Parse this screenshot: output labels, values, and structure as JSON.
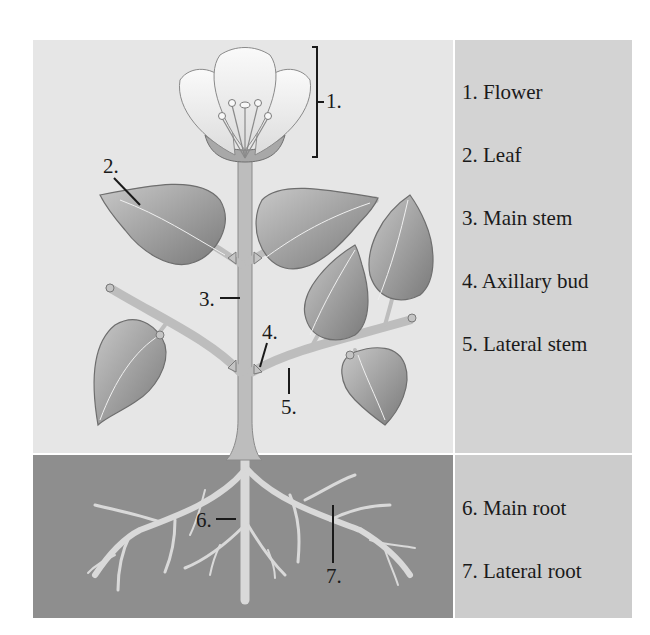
{
  "diagram": {
    "colors": {
      "sky_bg": "#e6e6e6",
      "soil_bg": "#8e8e8e",
      "legend_top_bg": "#d3d3d3",
      "legend_bottom_bg": "#cccccc",
      "text": "#1a1a1a",
      "leaf_fill": "#9e9e9e",
      "stem_fill": "#bdbdbd",
      "root_fill": "#d9d9d9",
      "petal_fill": "#f4f4f4"
    },
    "callouts": [
      {
        "id": "1",
        "text": "1."
      },
      {
        "id": "2",
        "text": "2."
      },
      {
        "id": "3",
        "text": "3."
      },
      {
        "id": "4",
        "text": "4."
      },
      {
        "id": "5",
        "text": "5."
      },
      {
        "id": "6",
        "text": "6."
      },
      {
        "id": "7",
        "text": "7."
      }
    ],
    "legend": {
      "above_ground": [
        {
          "number": "1.",
          "label": "1. Flower"
        },
        {
          "number": "2.",
          "label": "2. Leaf"
        },
        {
          "number": "3.",
          "label": "3. Main stem"
        },
        {
          "number": "4.",
          "label": "4. Axillary bud"
        },
        {
          "number": "5.",
          "label": "5. Lateral stem"
        }
      ],
      "below_ground": [
        {
          "number": "6.",
          "label": "6. Main root"
        },
        {
          "number": "7.",
          "label": "7. Lateral root"
        }
      ]
    }
  }
}
